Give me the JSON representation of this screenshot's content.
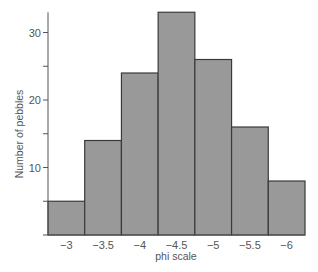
{
  "chart_data": {
    "type": "bar",
    "title": "",
    "xlabel": "phi scale",
    "ylabel": "Number of pebbles",
    "categories": [
      "-3",
      "-3.5",
      "-4",
      "-4.5",
      "-5",
      "-5.5",
      "-6"
    ],
    "category_labels": [
      "−3",
      "−3.5",
      "−4",
      "−4.5",
      "−5",
      "−5.5",
      "−6"
    ],
    "values": [
      5,
      14,
      24,
      33,
      26,
      16,
      8
    ],
    "ylim": [
      0,
      33
    ],
    "yticks": [
      10,
      20,
      30
    ],
    "yticks_minor": [
      5,
      15,
      25
    ],
    "grid": false,
    "legend": null,
    "histogram": true,
    "colors": {
      "bar_fill": "#999999",
      "bar_edge": "#3a3a3a",
      "axis": "#555555",
      "text": "#555555"
    }
  }
}
